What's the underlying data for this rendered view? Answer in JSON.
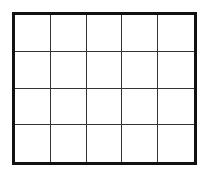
{
  "diagram": {
    "type": "grid",
    "rows": 4,
    "columns": 5,
    "cells": [
      [
        "",
        "",
        "",
        "",
        ""
      ],
      [
        "",
        "",
        "",
        "",
        ""
      ],
      [
        "",
        "",
        "",
        "",
        ""
      ],
      [
        "",
        "",
        "",
        "",
        ""
      ]
    ],
    "colors": {
      "background": "#ffffff",
      "outer_border": "#111111",
      "inner_lines": "#333333"
    }
  }
}
